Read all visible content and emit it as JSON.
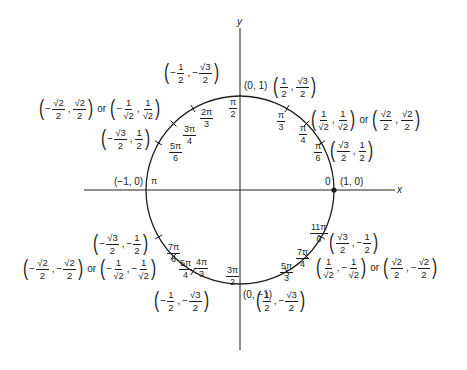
{
  "colors": {
    "ink": "#1e1e1e",
    "background": "#ffffff"
  },
  "axes": {
    "x_label": "x",
    "y_label": "y"
  },
  "geometry": {
    "center": [
      240,
      190
    ],
    "radius": 94
  },
  "intercepts": {
    "right": {
      "coord": "(1, 0)",
      "angle": "0"
    },
    "top": {
      "coord": "(0, 1)",
      "angle_num": "π",
      "angle_den": "2"
    },
    "left": {
      "coord": "(−1, 0)",
      "angle": "π"
    },
    "bottom": {
      "coord": "(0, −1)",
      "angle_num": "3π",
      "angle_den": "2"
    }
  },
  "points": [
    {
      "angle": {
        "num": "π",
        "den": "6"
      },
      "coord": {
        "x": {
          "sign": "",
          "num": "√3",
          "den": "2"
        },
        "y": {
          "sign": "",
          "num": "1",
          "den": "2"
        }
      }
    },
    {
      "angle": {
        "num": "π",
        "den": "4"
      },
      "coord": {
        "x": {
          "sign": "",
          "num": "1",
          "den": "√2"
        },
        "y": {
          "sign": "",
          "num": "1",
          "den": "√2"
        }
      },
      "or_word": "or",
      "alt": {
        "x": {
          "sign": "",
          "num": "√2",
          "den": "2"
        },
        "y": {
          "sign": "",
          "num": "√2",
          "den": "2"
        }
      }
    },
    {
      "angle": {
        "num": "π",
        "den": "3"
      },
      "coord": {
        "x": {
          "sign": "",
          "num": "1",
          "den": "2"
        },
        "y": {
          "sign": "",
          "num": "√3",
          "den": "2"
        }
      }
    },
    {
      "angle": {
        "num": "2π",
        "den": "3"
      },
      "coord": {
        "x": {
          "sign": "−",
          "num": "1",
          "den": "2"
        },
        "y": {
          "sign": "−",
          "num": "√3",
          "den": "2"
        }
      }
    },
    {
      "angle": {
        "num": "3π",
        "den": "4"
      },
      "coord": {
        "x": {
          "sign": "−",
          "num": "√2",
          "den": "2"
        },
        "y": {
          "sign": "",
          "num": "√2",
          "den": "2"
        }
      },
      "or_word": "or",
      "alt": {
        "x": {
          "sign": "−",
          "num": "1",
          "den": "√2"
        },
        "y": {
          "sign": "",
          "num": "1",
          "den": "√2"
        }
      }
    },
    {
      "angle": {
        "num": "5π",
        "den": "6"
      },
      "coord": {
        "x": {
          "sign": "−",
          "num": "√3",
          "den": "2"
        },
        "y": {
          "sign": "",
          "num": "1",
          "den": "2"
        }
      }
    },
    {
      "angle": {
        "num": "7π",
        "den": "6"
      },
      "coord": {
        "x": {
          "sign": "−",
          "num": "√3",
          "den": "2"
        },
        "y": {
          "sign": "−",
          "num": "1",
          "den": "2"
        }
      }
    },
    {
      "angle": {
        "num": "5π",
        "den": "4"
      },
      "coord": {
        "x": {
          "sign": "−",
          "num": "√2",
          "den": "2"
        },
        "y": {
          "sign": "−",
          "num": "√2",
          "den": "2"
        }
      },
      "or_word": "or",
      "alt": {
        "x": {
          "sign": "−",
          "num": "1",
          "den": "√2"
        },
        "y": {
          "sign": "−",
          "num": "1",
          "den": "√2"
        }
      }
    },
    {
      "angle": {
        "num": "4π",
        "den": "3"
      },
      "coord": {
        "x": {
          "sign": "−",
          "num": "1",
          "den": "2"
        },
        "y": {
          "sign": "−",
          "num": "√3",
          "den": "2"
        }
      }
    },
    {
      "angle": {
        "num": "5π",
        "den": "3"
      },
      "coord": {
        "x": {
          "sign": "",
          "num": "1",
          "den": "2"
        },
        "y": {
          "sign": "−",
          "num": "√3",
          "den": "2"
        }
      }
    },
    {
      "angle": {
        "num": "7π",
        "den": "4"
      },
      "coord": {
        "x": {
          "sign": "",
          "num": "1",
          "den": "√2"
        },
        "y": {
          "sign": "−",
          "num": "1",
          "den": "√2"
        }
      },
      "or_word": "or",
      "alt": {
        "x": {
          "sign": "",
          "num": "√2",
          "den": "2"
        },
        "y": {
          "sign": "−",
          "num": "√2",
          "den": "2"
        }
      }
    },
    {
      "angle": {
        "num": "11π",
        "den": "6"
      },
      "coord": {
        "x": {
          "sign": "",
          "num": "√3",
          "den": "2"
        },
        "y": {
          "sign": "−",
          "num": "1",
          "den": "2"
        }
      }
    }
  ],
  "punct": {
    "lparen": "(",
    "rparen": ")",
    "comma": ","
  }
}
